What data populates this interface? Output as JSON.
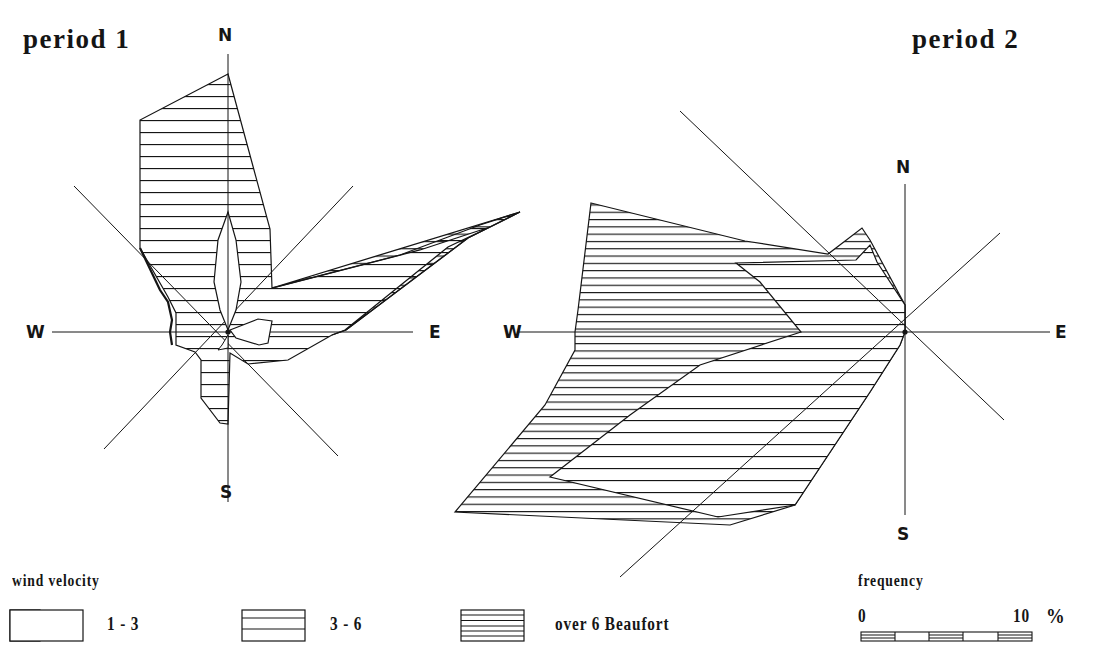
{
  "figure": {
    "panels": [
      {
        "id": "period1",
        "title": "period 1",
        "directions": {
          "n": "N",
          "s": "S",
          "e": "E",
          "w": "W"
        }
      },
      {
        "id": "period2",
        "title": "period 2",
        "directions": {
          "n": "N",
          "s": "S",
          "e": "E",
          "w": "W"
        }
      }
    ],
    "legend": {
      "title": "wind velocity",
      "items": [
        {
          "label": "1 - 3",
          "pattern": "empty"
        },
        {
          "label": "3 - 6",
          "pattern": "sparse-hatch"
        },
        {
          "label": "over 6 Beaufort",
          "pattern": "dense-hatch"
        }
      ]
    },
    "scale": {
      "title": "frequency",
      "min_label": "0",
      "max_label": "10",
      "unit": "%"
    },
    "colors": {
      "ink": "#151515",
      "background": "#ffffff"
    }
  }
}
